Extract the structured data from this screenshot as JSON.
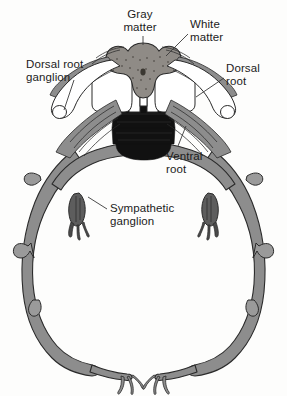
{
  "figure": {
    "background_color": "#fdfdfc"
  },
  "palette": {
    "nerve_fill": "#8d8d8d",
    "nerve_fill_light": "#9a9a9a",
    "gray_matter": "#8f8b86",
    "white_matter": "#ffffff",
    "vertebra_dark": "#111111",
    "outline": "#2a2a2a",
    "leader_line": "#3a3a3a",
    "text": "#1b1b1b"
  },
  "labels": [
    {
      "id": "gray-matter",
      "text": "Gray\nmatter",
      "x": 120,
      "y": 8,
      "align": "center"
    },
    {
      "id": "white-matter",
      "text": "White\nmatter",
      "x": 190,
      "y": 18,
      "align": "left"
    },
    {
      "id": "dorsal-root-ganglion",
      "text": "Dorsal root\nganglion",
      "x": 26,
      "y": 58,
      "align": "left"
    },
    {
      "id": "dorsal-root",
      "text": "Dorsal\nroot",
      "x": 226,
      "y": 62,
      "align": "left"
    },
    {
      "id": "ventral-root",
      "text": "Ventral\nroot",
      "x": 166,
      "y": 150,
      "align": "left"
    },
    {
      "id": "sympathetic-ganglion",
      "text": "Sympathetic\nganglion",
      "x": 110,
      "y": 202,
      "align": "left"
    }
  ],
  "structures": [
    {
      "id": "gray-matter",
      "name": "Gray matter",
      "description": "Butterfly-shaped central region of the spinal cord"
    },
    {
      "id": "white-matter",
      "name": "White matter",
      "description": "Pale tissue surrounding the gray matter"
    },
    {
      "id": "dorsal-root-ganglion",
      "name": "Dorsal root ganglion",
      "description": "Rounded pale swelling on the dorsal root, one on each side"
    },
    {
      "id": "dorsal-root",
      "name": "Dorsal root",
      "description": "Sensory root entering the dorsal spinal cord"
    },
    {
      "id": "ventral-root",
      "name": "Ventral root",
      "description": "Motor root leaving the ventral spinal cord"
    },
    {
      "id": "sympathetic-ganglion",
      "name": "Sympathetic ganglion",
      "description": "Small dark teardrop ganglion on the nerve ring"
    },
    {
      "id": "vertebral-column",
      "name": "Vertebral column",
      "description": "Dark segmented column below the cord"
    },
    {
      "id": "spinal-nerve-ring",
      "name": "Spinal nerve ring",
      "description": "Large ring of spinal nerves encircling the body wall"
    }
  ]
}
